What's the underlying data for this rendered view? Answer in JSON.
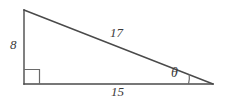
{
  "figure": {
    "kind": "right-triangle-diagram",
    "background_color": "#ffffff",
    "stroke_color": "#4a4a4a",
    "label_color": "#3a3a3a"
  },
  "labels": {
    "vertical_leg": "8",
    "hypotenuse": "17",
    "horizontal_leg": "15",
    "angle": "θ"
  },
  "markers": {
    "right_angle_name": "right-angle-square",
    "angle_arc_name": "angle-arc"
  },
  "geometry": {
    "vertices": {
      "top_left": [
        24,
        10
      ],
      "bottom_left": [
        24,
        84
      ],
      "bottom_right": [
        213,
        84
      ]
    },
    "right_angle_square": {
      "x": 24,
      "y": 70,
      "size": 15
    },
    "angle_arc_center": [
      213,
      84
    ],
    "angle_arc_radius": 25
  }
}
